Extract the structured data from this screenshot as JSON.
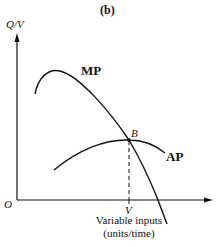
{
  "figure": {
    "panel_label": "(b)",
    "y_axis_label": "Q/V",
    "x_axis_label_line1": "Variable inputs",
    "x_axis_label_line2": "(units/time)",
    "origin_label": "O",
    "x_marker_label": "V",
    "point_label": "B",
    "curves": [
      {
        "name": "MP",
        "label": "MP",
        "description": "Marginal product: rises to a peak then falls steeply, crossing AP at its maximum B and going below the x-axis"
      },
      {
        "name": "AP",
        "label": "AP",
        "description": "Average product: inverted-U, maximum at point B"
      }
    ],
    "annotations": {
      "dashed_line": "vertical dashed line from B down to V on the x-axis"
    },
    "colors": {
      "line": "#111111",
      "background": "#ffffff"
    }
  }
}
